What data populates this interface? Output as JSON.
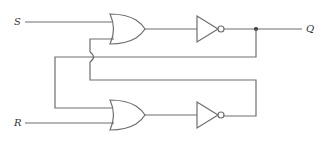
{
  "diagram": {
    "type": "SR latch (NOR-based, drawn as OR gates followed by inverters)",
    "inputs": [
      {
        "id": "S",
        "label": "S"
      },
      {
        "id": "R",
        "label": "R"
      }
    ],
    "outputs": [
      {
        "id": "Q",
        "label": "Q"
      }
    ],
    "components": [
      {
        "id": "or-top",
        "kind": "OR gate",
        "inputs": [
          "S",
          "feedback-from-bottom"
        ]
      },
      {
        "id": "not-top",
        "kind": "NOT gate",
        "input": "or-top"
      },
      {
        "id": "or-bottom",
        "kind": "OR gate",
        "inputs": [
          "feedback-from-Q",
          "R"
        ]
      },
      {
        "id": "not-bottom",
        "kind": "NOT gate",
        "input": "or-bottom"
      }
    ],
    "features": {
      "junction_dot": "on Q output line",
      "wire_crossover": "jumper arc where feedback wires cross"
    },
    "colors": {
      "wire": "#6e6e6e",
      "label": "#333333",
      "background": "#ffffff"
    }
  }
}
